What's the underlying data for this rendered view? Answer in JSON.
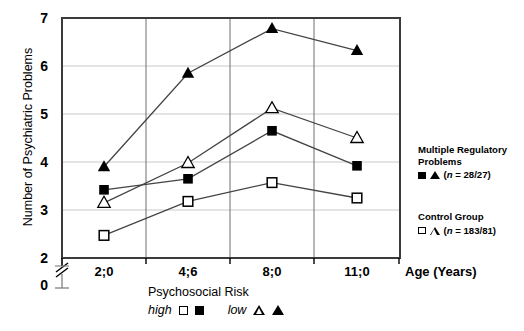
{
  "chart_data": {
    "type": "line",
    "title": "",
    "xlabel": "Age (Years)",
    "ylabel": "Number of Psychiatric Problems",
    "categories": [
      "2;0",
      "4;6",
      "8;0",
      "11;0"
    ],
    "ylim": [
      2,
      7
    ],
    "yticks": [
      2,
      3,
      4,
      5,
      6,
      7
    ],
    "yaxis_break_label": "0",
    "grid": "horizontal-and-vertical",
    "legend_position": "right",
    "series": [
      {
        "name": "Multiple Regulatory Problems / high psychosocial risk",
        "marker": "filled-triangle",
        "values": [
          3.9,
          5.85,
          6.78,
          6.32
        ]
      },
      {
        "name": "Control Group / high psychosocial risk",
        "marker": "open-triangle",
        "values": [
          3.15,
          3.98,
          5.12,
          4.5
        ]
      },
      {
        "name": "Multiple Regulatory Problems / low psychosocial risk",
        "marker": "filled-square",
        "values": [
          3.42,
          3.65,
          4.65,
          3.92
        ]
      },
      {
        "name": "Control Group / low psychosocial risk",
        "marker": "open-square",
        "values": [
          2.47,
          3.18,
          3.57,
          3.25
        ]
      }
    ]
  },
  "axis": {
    "y_label": "Number of Psychiatric Problems",
    "y_ticks": [
      "7",
      "6",
      "5",
      "4",
      "3",
      "2"
    ],
    "y_zero": "0",
    "x_ticks": [
      "2;0",
      "4;6",
      "8;0",
      "11;0"
    ],
    "x_label": "Age (Years)"
  },
  "risk_legend": {
    "title": "Psychosocial Risk",
    "high_label": "high",
    "low_label": "low",
    "high_markers": [
      "open-square",
      "filled-square"
    ],
    "low_markers": [
      "open-triangle",
      "filled-triangle"
    ]
  },
  "legend": {
    "group1_line1": "Multiple Regulatory",
    "group1_line2": "Problems",
    "group1_n": "(n = 28/27)",
    "group1_n_italic": "n",
    "group2_line1": "Control Group",
    "group2_n": "(n = 183/81)"
  },
  "colors": {
    "ink": "#000000",
    "grid": "#c8c8c8",
    "background": "#ffffff"
  }
}
